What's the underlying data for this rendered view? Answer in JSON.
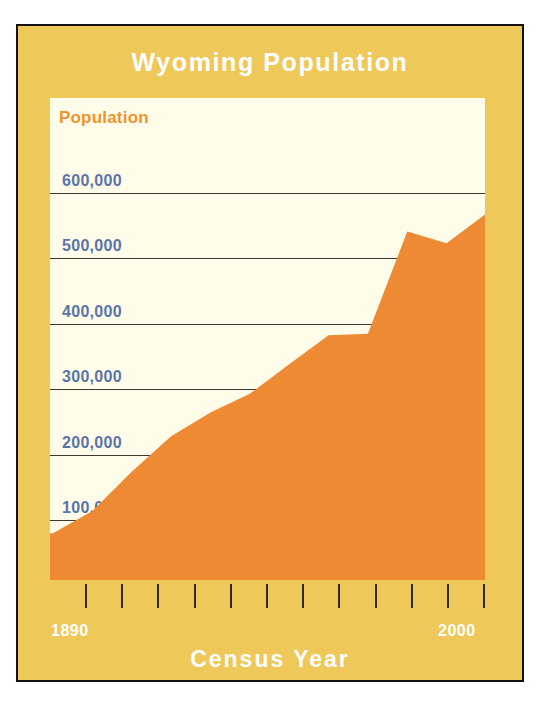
{
  "chart_data": {
    "type": "area",
    "title": "Wyoming Population",
    "xlabel": "Census Year",
    "ylabel": "Population",
    "x": [
      1890,
      1900,
      1910,
      1920,
      1930,
      1940,
      1950,
      1960,
      1970,
      1980,
      1990,
      2000
    ],
    "categories": [
      "1890",
      "1900",
      "1910",
      "1920",
      "1930",
      "1940",
      "1950",
      "1960",
      "1970",
      "1980",
      "1990",
      "2000"
    ],
    "values": [
      63000,
      93000,
      146000,
      194000,
      226000,
      251000,
      291000,
      330000,
      332000,
      470000,
      454000,
      494000
    ],
    "series": [
      {
        "name": "Population",
        "values": [
          63000,
          93000,
          146000,
          194000,
          226000,
          251000,
          291000,
          330000,
          332000,
          470000,
          454000,
          494000
        ]
      }
    ],
    "ylim": [
      0,
      650000
    ],
    "xlim": [
      1890,
      2000
    ],
    "yticks": [
      0,
      100000,
      200000,
      300000,
      400000,
      500000,
      600000
    ],
    "ytick_labels": [
      "0",
      "100,000",
      "200,000",
      "300,000",
      "400,000",
      "500,000",
      "600,000"
    ],
    "xtick_labels_shown": [
      "1890",
      "2000"
    ],
    "xtick_count": 12,
    "grid": true,
    "legend": "none",
    "colors": {
      "frame": "#EFC85A",
      "plot_background": "#FFFDEA",
      "area_fill": "#ED8A33",
      "gridline": "#3d3a33",
      "ytick_text": "#5A74A8",
      "ylabel_text": "#F0932E",
      "title_text": "#FFFFFF",
      "border": "#14110C"
    }
  }
}
